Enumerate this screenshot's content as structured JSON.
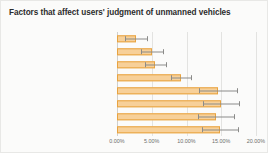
{
  "chart_data": {
    "type": "bar",
    "orientation": "horizontal",
    "title": "Factors that affect users' judgment of unmanned vehicles",
    "xlabel": "",
    "ylabel": "",
    "xlim": [
      0,
      20
    ],
    "xtick_labels": [
      "0.00%",
      "5.00%",
      "10.00%",
      "15.00%",
      "20.00%"
    ],
    "xtick_values": [
      0,
      5,
      10,
      15,
      20
    ],
    "grid": true,
    "legend": false,
    "bar_color": "#f7d099",
    "bar_border_color": "#e8a33f",
    "error_bar_color": "#8b8b89",
    "categories": [
      "large in size",
      "direction",
      "distance",
      "whether there is a message prompt",
      "the next driving state",
      "headlight",
      "acceleration",
      "speed"
    ],
    "values": [
      2.7,
      5.0,
      5.5,
      9.2,
      14.5,
      15.0,
      14.2,
      14.8
    ],
    "error_high": [
      4.3,
      6.6,
      7.0,
      10.6,
      17.2,
      17.6,
      16.8,
      17.4
    ],
    "units": "percent"
  }
}
